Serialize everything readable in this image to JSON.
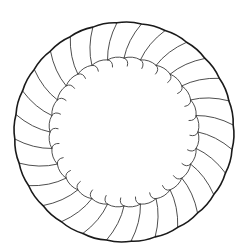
{
  "figure": {
    "segment_count": 28,
    "colors": {
      "background": "#ffffff",
      "outer_rim": "#1a1a1a",
      "lines": "#3a3a3a"
    }
  }
}
